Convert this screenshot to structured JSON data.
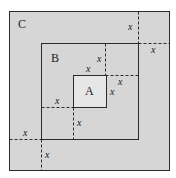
{
  "colors": {
    "background": "#ffffff",
    "outer_fill": "#d6d6d6",
    "inner_fill": "#e6e6e6",
    "stroke": "#2a2a2a"
  },
  "squares": {
    "C": {
      "label": "C",
      "x": 9,
      "y": 11,
      "w": 160,
      "h": 159,
      "label_x": 18,
      "label_y": 28
    },
    "B": {
      "label": "B",
      "x": 41,
      "y": 43,
      "w": 97,
      "h": 96,
      "label_x": 51,
      "label_y": 62
    },
    "A": {
      "label": "A",
      "x": 73,
      "y": 75,
      "w": 33,
      "h": 32,
      "label_x": 85,
      "label_y": 95
    }
  },
  "dashed_lines": [
    {
      "x1": 138,
      "y1": 11,
      "x2": 138,
      "y2": 43
    },
    {
      "x1": 138,
      "y1": 43,
      "x2": 169,
      "y2": 43
    },
    {
      "x1": 105,
      "y1": 43,
      "x2": 105,
      "y2": 75
    },
    {
      "x1": 105,
      "y1": 75,
      "x2": 138,
      "y2": 75
    },
    {
      "x1": 41,
      "y1": 107,
      "x2": 73,
      "y2": 107
    },
    {
      "x1": 73,
      "y1": 107,
      "x2": 73,
      "y2": 139
    },
    {
      "x1": 9,
      "y1": 139,
      "x2": 41,
      "y2": 139
    },
    {
      "x1": 41,
      "y1": 139,
      "x2": 41,
      "y2": 170
    }
  ],
  "variable_labels": {
    "text": "x",
    "positions": [
      {
        "x": 128,
        "y": 30
      },
      {
        "x": 151,
        "y": 53
      },
      {
        "x": 97,
        "y": 62
      },
      {
        "x": 86,
        "y": 72
      },
      {
        "x": 118,
        "y": 85
      },
      {
        "x": 110,
        "y": 95
      },
      {
        "x": 55,
        "y": 104
      },
      {
        "x": 77,
        "y": 126
      },
      {
        "x": 23,
        "y": 136
      },
      {
        "x": 45,
        "y": 158
      }
    ]
  }
}
